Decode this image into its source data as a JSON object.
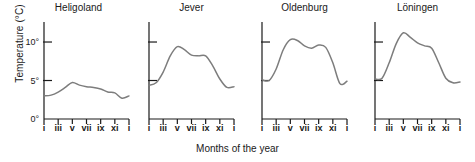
{
  "chart_data": {
    "type": "line",
    "title": "",
    "xlabel": "Months of the year",
    "ylabel": "Temperature (°C)",
    "xlim": [
      1,
      13
    ],
    "ylim": [
      0,
      12.6
    ],
    "grid": false,
    "legend": "none",
    "line_color": "#7d7d7d",
    "axis_color": "#1a1a1a",
    "x": [
      1,
      2,
      3,
      4,
      5,
      6,
      7,
      8,
      9,
      10,
      11,
      12,
      13
    ],
    "xtick_labels": [
      "i",
      "iii",
      "v",
      "vii",
      "ix",
      "xi",
      "i"
    ],
    "xtick_positions": [
      1,
      3,
      5,
      7,
      9,
      11,
      13
    ],
    "ytick_labels": [
      "0°",
      "5°",
      "10°"
    ],
    "ytick_values": [
      0,
      5,
      10
    ],
    "panels": [
      {
        "name": "Heligoland",
        "show_ytick_labels": true,
        "values": [
          3.0,
          3.1,
          3.5,
          4.1,
          4.75,
          4.4,
          4.2,
          4.1,
          3.9,
          3.5,
          3.4,
          2.7,
          3.0
        ]
      },
      {
        "name": "Jever",
        "show_ytick_labels": false,
        "values": [
          4.4,
          4.7,
          6.1,
          8.2,
          9.4,
          9.0,
          8.3,
          8.2,
          8.2,
          6.9,
          5.2,
          4.1,
          4.2
        ]
      },
      {
        "name": "Oldenburg",
        "show_ytick_labels": false,
        "values": [
          5.1,
          5.0,
          6.5,
          9.0,
          10.3,
          10.2,
          9.5,
          9.2,
          9.6,
          9.3,
          7.3,
          4.6,
          4.9
        ]
      },
      {
        "name": "Löningen",
        "show_ytick_labels": false,
        "values": [
          5.2,
          5.3,
          7.3,
          9.8,
          11.2,
          10.6,
          9.9,
          9.5,
          9.2,
          7.3,
          5.3,
          4.7,
          4.8
        ]
      }
    ]
  }
}
